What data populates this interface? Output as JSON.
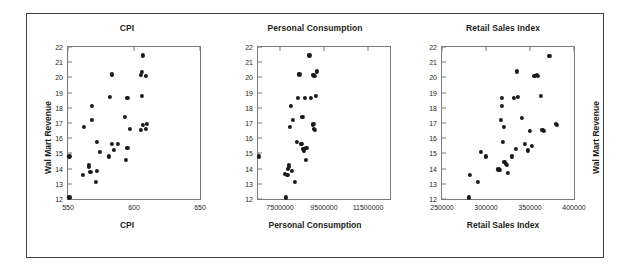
{
  "figure": {
    "background": "#ffffff",
    "border_color": "#404040",
    "marker_color": "#1a1a1a",
    "axis_color": "#7a7a7a"
  },
  "chart_data": [
    {
      "type": "scatter",
      "title": "CPI",
      "xlabel": "CPI",
      "ylabel": "Wal Mart Revenue",
      "ylabel_side": "left",
      "xlim": [
        550,
        650
      ],
      "ylim": [
        12,
        22
      ],
      "xticks": [
        550,
        600,
        650
      ],
      "yticks": [
        12,
        13,
        14,
        15,
        16,
        17,
        18,
        19,
        20,
        21,
        22
      ],
      "grid": false,
      "legend": "none",
      "points": [
        [
          551,
          12.1
        ],
        [
          551,
          14.8
        ],
        [
          561,
          13.6
        ],
        [
          562,
          16.75
        ],
        [
          566,
          14.25
        ],
        [
          566,
          14.1
        ],
        [
          567,
          13.8
        ],
        [
          568,
          17.2
        ],
        [
          568,
          18.1
        ],
        [
          571,
          13.1
        ],
        [
          572,
          13.85
        ],
        [
          572,
          15.75
        ],
        [
          574,
          15.1
        ],
        [
          581,
          14.8
        ],
        [
          582,
          18.7
        ],
        [
          583,
          15.65
        ],
        [
          583,
          20.2
        ],
        [
          585,
          15.25
        ],
        [
          588,
          15.65
        ],
        [
          593,
          17.4
        ],
        [
          594,
          14.55
        ],
        [
          595,
          18.65
        ],
        [
          595,
          15.35
        ],
        [
          597,
          16.6
        ],
        [
          605,
          16.55
        ],
        [
          605,
          20.15
        ],
        [
          606,
          20.35
        ],
        [
          606,
          18.8
        ],
        [
          607,
          21.45
        ],
        [
          607,
          16.9
        ],
        [
          609,
          20.1
        ],
        [
          609,
          16.6
        ],
        [
          610,
          16.95
        ]
      ]
    },
    {
      "type": "scatter",
      "title": "Personal Consumption",
      "xlabel": "Personal Consumption",
      "ylabel": "",
      "ylabel_side": "none",
      "xlim": [
        6500000,
        12500000
      ],
      "ylim": [
        12,
        22
      ],
      "xticks": [
        7500000,
        9500000,
        11500000
      ],
      "yticks": [
        12,
        13,
        14,
        15,
        16,
        17,
        18,
        19,
        20,
        21,
        22
      ],
      "grid": false,
      "legend": "none",
      "points": [
        [
          6540000,
          14.8
        ],
        [
          7770000,
          12.1
        ],
        [
          7840000,
          13.6
        ],
        [
          7860000,
          14.0
        ],
        [
          7900000,
          14.1
        ],
        [
          7920000,
          14.25
        ],
        [
          7960000,
          16.75
        ],
        [
          7980000,
          18.1
        ],
        [
          8040000,
          13.85
        ],
        [
          8100000,
          17.2
        ],
        [
          8180000,
          13.1
        ],
        [
          8260000,
          15.75
        ],
        [
          8300000,
          18.65
        ],
        [
          8380000,
          20.2
        ],
        [
          8460000,
          15.6
        ],
        [
          8480000,
          15.65
        ],
        [
          8520000,
          17.4
        ],
        [
          8560000,
          15.3
        ],
        [
          8580000,
          15.2
        ],
        [
          8620000,
          18.65
        ],
        [
          8660000,
          14.55
        ],
        [
          8700000,
          15.35
        ],
        [
          8840000,
          21.45
        ],
        [
          8900000,
          18.65
        ],
        [
          9000000,
          16.9
        ],
        [
          9020000,
          16.95
        ],
        [
          9020000,
          20.15
        ],
        [
          9040000,
          16.6
        ],
        [
          9060000,
          20.1
        ],
        [
          9080000,
          16.55
        ],
        [
          9140000,
          18.8
        ],
        [
          9160000,
          20.4
        ],
        [
          7720000,
          13.65
        ]
      ]
    },
    {
      "type": "scatter",
      "title": "Retail Sales Index",
      "xlabel": "Retail Sales Index",
      "ylabel": "Wal Mart Revenue",
      "ylabel_side": "right",
      "xlim": [
        250000,
        400000
      ],
      "ylim": [
        12,
        22
      ],
      "xticks": [
        250000,
        300000,
        350000,
        400000
      ],
      "yticks": [
        12,
        13,
        14,
        15,
        16,
        17,
        18,
        19,
        20,
        21,
        22
      ],
      "grid": false,
      "legend": "none",
      "points": [
        [
          281000,
          12.1
        ],
        [
          282000,
          13.6
        ],
        [
          291000,
          13.1
        ],
        [
          294000,
          15.1
        ],
        [
          300000,
          14.8
        ],
        [
          314000,
          13.95
        ],
        [
          316000,
          13.9
        ],
        [
          317000,
          17.2
        ],
        [
          318000,
          18.1
        ],
        [
          318000,
          18.65
        ],
        [
          319000,
          15.75
        ],
        [
          320000,
          16.75
        ],
        [
          321000,
          14.45
        ],
        [
          323000,
          14.3
        ],
        [
          324000,
          14.25
        ],
        [
          325000,
          13.7
        ],
        [
          329000,
          14.8
        ],
        [
          332000,
          18.65
        ],
        [
          334000,
          15.3
        ],
        [
          335000,
          20.4
        ],
        [
          336000,
          18.7
        ],
        [
          341000,
          17.35
        ],
        [
          344000,
          15.6
        ],
        [
          348000,
          15.2
        ],
        [
          350000,
          16.5
        ],
        [
          352000,
          15.5
        ],
        [
          355000,
          20.1
        ],
        [
          358000,
          20.15
        ],
        [
          359000,
          20.1
        ],
        [
          362000,
          18.8
        ],
        [
          364000,
          16.55
        ],
        [
          366000,
          16.5
        ],
        [
          372000,
          21.4
        ],
        [
          379000,
          16.95
        ],
        [
          381000,
          16.9
        ]
      ]
    }
  ]
}
